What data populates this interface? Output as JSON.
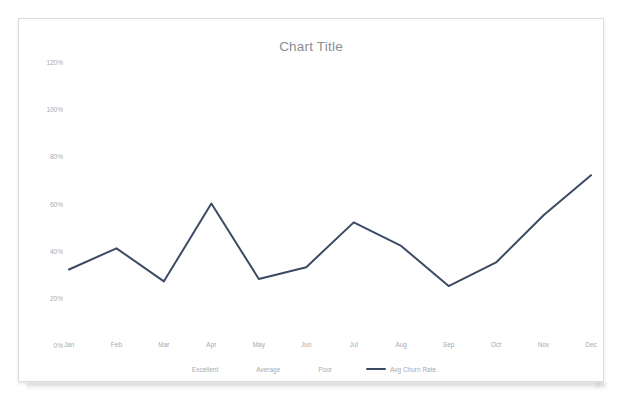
{
  "card": {
    "title": "Chart Title",
    "accent_color": "#3c4b63",
    "axis_text_color": "#a7aab0",
    "title_color": "#8b8e95",
    "border_color": "#dcdcdc"
  },
  "chart_data": {
    "type": "line",
    "title": "Chart Title",
    "xlabel": "",
    "ylabel": "",
    "categories": [
      "Jan",
      "Feb",
      "Mar",
      "Apr",
      "May",
      "Jun",
      "Jul",
      "Aug",
      "Sep",
      "Oct",
      "Nov",
      "Dec"
    ],
    "ylim": [
      0,
      120
    ],
    "ytick_labels": [
      "120%",
      "100%",
      "80%",
      "60%",
      "40%",
      "20%",
      "0%"
    ],
    "ytick_values": [
      120,
      100,
      80,
      60,
      40,
      20,
      0
    ],
    "grid": false,
    "legend_position": "bottom",
    "legend": [
      "Excellent",
      "Average",
      "Poor",
      "Avg Churn Rate"
    ],
    "series": [
      {
        "name": "Excellent",
        "color": "#3c4b63",
        "visible": false,
        "values": [
          null,
          null,
          null,
          null,
          null,
          null,
          null,
          null,
          null,
          null,
          null,
          null
        ]
      },
      {
        "name": "Average",
        "color": "#3c4b63",
        "visible": false,
        "values": [
          null,
          null,
          null,
          null,
          null,
          null,
          null,
          null,
          null,
          null,
          null,
          null
        ]
      },
      {
        "name": "Poor",
        "color": "#3c4b63",
        "visible": false,
        "values": [
          null,
          null,
          null,
          null,
          null,
          null,
          null,
          null,
          null,
          null,
          null,
          null
        ]
      },
      {
        "name": "Avg Churn Rate",
        "color": "#3c4b63",
        "visible": true,
        "values": [
          32,
          41,
          27,
          60,
          28,
          33,
          52,
          42,
          25,
          35,
          55,
          72
        ]
      }
    ]
  }
}
